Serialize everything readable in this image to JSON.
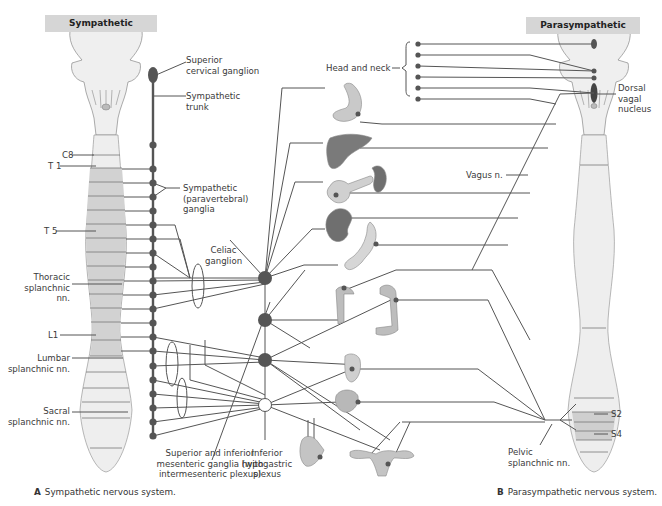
{
  "headers": {
    "sympathetic": "Sympathetic",
    "parasympathetic": "Parasympathetic"
  },
  "labels": {
    "superior_cervical_ganglion": [
      "Superior",
      "cervical ganglion"
    ],
    "sympathetic_trunk": [
      "Sympathetic",
      "trunk"
    ],
    "sympathetic_ganglia": [
      "Sympathetic",
      "(paravertebral)",
      "ganglia"
    ],
    "celiac_ganglion": [
      "Celiac",
      "ganglion"
    ],
    "thoracic_splanchnic": [
      "Thoracic",
      "splanchnic",
      "nn."
    ],
    "lumbar_splanchnic": [
      "Lumbar",
      "splanchnic nn."
    ],
    "sacral_splanchnic": [
      "Sacral",
      "splanchnic nn."
    ],
    "mesenteric_ganglia": [
      "Superior and inferior",
      "mesenteric ganglia (with",
      "intermesenteric plexus)"
    ],
    "inferior_hypogastric": [
      "Inferior",
      "hypogastric",
      "plexus"
    ],
    "head_and_neck": "Head and neck",
    "dorsal_vagal_nucleus": [
      "Dorsal",
      "vagal",
      "nucleus"
    ],
    "vagus": "Vagus n.",
    "pelvic_splanchnic": [
      "Pelvic",
      "splanchnic nn."
    ],
    "segments": {
      "c8": "C8",
      "t1": "T 1",
      "t5": "T 5",
      "l1": "L1",
      "s2": "S2",
      "s4": "S4"
    }
  },
  "captions": {
    "a_letter": "A",
    "a_text": "Sympathetic nervous system.",
    "b_letter": "B",
    "b_text": "Parasympathetic nervous system."
  },
  "organs": [
    "eye/head",
    "stomach",
    "liver",
    "pancreas",
    "spleen",
    "kidney",
    "small intestine",
    "ascending colon",
    "descending colon",
    "rectum",
    "bladder",
    "prostate/male genitalia",
    "uterus/female genitalia"
  ],
  "colors": {
    "nerve_line": "#4a4a4a",
    "ganglion": "#555555",
    "header_bg": "#d6d6d6",
    "cord_light": "#eeeeee",
    "cord_shaded": "#d2d2d2",
    "organ": "#9a9a9a"
  }
}
